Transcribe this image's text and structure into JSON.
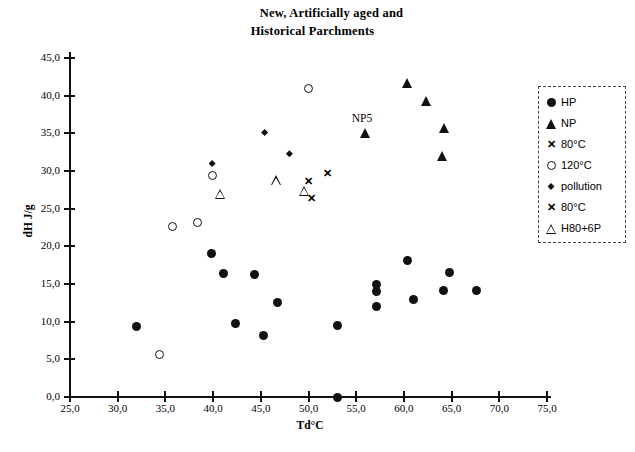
{
  "chart_data": {
    "type": "scatter",
    "title": "New, Artificially aged and Historical Parchments",
    "title_lines": [
      "New, Artificially aged and",
      "Historical Parchments"
    ],
    "xlabel": "Td°C",
    "ylabel": "dH J/g",
    "xlim": [
      25.0,
      75.0
    ],
    "ylim": [
      0.0,
      45.0
    ],
    "xticks": [
      "25,0",
      "30,0",
      "35,0",
      "40,0",
      "45,0",
      "50,0",
      "55,0",
      "60,0",
      "65,0",
      "70,0",
      "75,0"
    ],
    "yticks": [
      "0,0",
      "5,0",
      "10,0",
      "15,0",
      "20,0",
      "25,0",
      "30,0",
      "35,0",
      "40,0",
      "45,0"
    ],
    "xtick_values": [
      25,
      30,
      35,
      40,
      45,
      50,
      55,
      60,
      65,
      70,
      75
    ],
    "ytick_values": [
      0,
      5,
      10,
      15,
      20,
      25,
      30,
      35,
      40,
      45
    ],
    "grid": false,
    "legend_position": "right",
    "annotations": [
      {
        "text": "NP5",
        "x": 56.0,
        "y": 36.9
      }
    ],
    "series": [
      {
        "name": "HP",
        "marker": "circle-filled",
        "points": [
          {
            "x": 32.0,
            "y": 9.3
          },
          {
            "x": 39.8,
            "y": 19.0
          },
          {
            "x": 41.1,
            "y": 16.4
          },
          {
            "x": 42.4,
            "y": 9.7
          },
          {
            "x": 44.3,
            "y": 16.2
          },
          {
            "x": 45.3,
            "y": 8.2
          },
          {
            "x": 46.8,
            "y": 12.5
          },
          {
            "x": 53.0,
            "y": 9.5
          },
          {
            "x": 53.0,
            "y": 0.0
          },
          {
            "x": 57.1,
            "y": 15.0
          },
          {
            "x": 57.1,
            "y": 14.0
          },
          {
            "x": 57.1,
            "y": 12.0
          },
          {
            "x": 60.4,
            "y": 18.1
          },
          {
            "x": 61.0,
            "y": 12.9
          },
          {
            "x": 64.8,
            "y": 16.5
          },
          {
            "x": 64.2,
            "y": 14.2
          },
          {
            "x": 67.6,
            "y": 14.2
          }
        ]
      },
      {
        "name": "NP",
        "marker": "triangle-filled",
        "points": [
          {
            "x": 56.0,
            "y": 35.0
          },
          {
            "x": 60.4,
            "y": 41.7
          },
          {
            "x": 62.4,
            "y": 39.3
          },
          {
            "x": 64.3,
            "y": 35.7
          },
          {
            "x": 64.0,
            "y": 32.0
          }
        ]
      },
      {
        "name": "80°C",
        "marker": "x-bold",
        "points": [
          {
            "x": 50.0,
            "y": 28.6
          },
          {
            "x": 50.3,
            "y": 26.4
          }
        ]
      },
      {
        "name": "120°C",
        "marker": "circle-open",
        "points": [
          {
            "x": 34.4,
            "y": 5.6
          },
          {
            "x": 35.7,
            "y": 22.6
          },
          {
            "x": 38.4,
            "y": 23.2
          },
          {
            "x": 39.9,
            "y": 29.4
          },
          {
            "x": 50.0,
            "y": 41.0
          }
        ]
      },
      {
        "name": "pollution",
        "marker": "diamond-filled",
        "points": [
          {
            "x": 39.9,
            "y": 31.0
          },
          {
            "x": 45.4,
            "y": 35.1
          },
          {
            "x": 48.0,
            "y": 32.3
          }
        ]
      },
      {
        "name": "80°C",
        "marker": "x-bold-2",
        "points": [
          {
            "x": 52.0,
            "y": 29.7
          }
        ]
      },
      {
        "name": "H80+6P",
        "marker": "triangle-open",
        "points": [
          {
            "x": 40.8,
            "y": 27.0
          },
          {
            "x": 46.6,
            "y": 28.8
          },
          {
            "x": 49.6,
            "y": 27.4
          }
        ]
      }
    ]
  },
  "legend": {
    "entries": [
      {
        "label": "HP",
        "marker": "circle-filled"
      },
      {
        "label": "NP",
        "marker": "triangle-filled"
      },
      {
        "label": "80°C",
        "marker": "x-bold"
      },
      {
        "label": "120°C",
        "marker": "circle-open"
      },
      {
        "label": "pollution",
        "marker": "diamond-filled"
      },
      {
        "label": "80°C",
        "marker": "x-bold"
      },
      {
        "label": "H80+6P",
        "marker": "triangle-open"
      }
    ]
  }
}
